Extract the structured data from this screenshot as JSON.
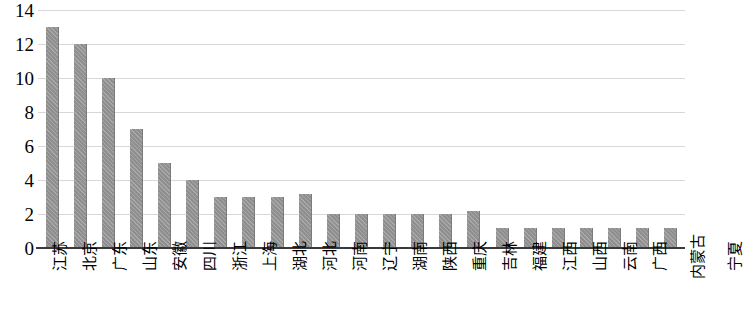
{
  "chart_data": {
    "type": "bar",
    "title": "",
    "subtitle": "",
    "xlabel": "",
    "ylabel": "",
    "ylim": [
      0,
      14
    ],
    "yticks": [
      0,
      2,
      4,
      6,
      8,
      10,
      12,
      14
    ],
    "grid": true,
    "legend": false,
    "legend_position": "none",
    "bar_color": "#8f8f8f",
    "gridline_color": "#d8d8d8",
    "axis_color": "#3a3a3a",
    "categories": [
      "江苏",
      "北京",
      "广东",
      "山东",
      "安徽",
      "四川",
      "浙江",
      "上海",
      "湖北",
      "河北",
      "河南",
      "辽宁",
      "湖南",
      "陕西",
      "重庆",
      "吉林",
      "福建",
      "江西",
      "山西",
      "云南",
      "广西",
      "内蒙古",
      "宁夏"
    ],
    "values": [
      13,
      12,
      10,
      7,
      5,
      4,
      3,
      3,
      3,
      3.2,
      2,
      2,
      2,
      2,
      2,
      2.2,
      1.2,
      1.2,
      1.2,
      1.2,
      1.2,
      1.2,
      1.2
    ],
    "series": [
      {
        "name": "",
        "values": [
          13,
          12,
          10,
          7,
          5,
          4,
          3,
          3,
          3,
          3.2,
          2,
          2,
          2,
          2,
          2,
          2.2,
          1.2,
          1.2,
          1.2,
          1.2,
          1.2,
          1.2,
          1.2
        ]
      }
    ]
  }
}
